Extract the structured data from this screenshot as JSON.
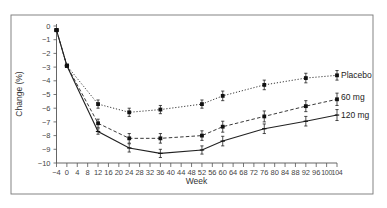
{
  "chart_data": {
    "type": "line",
    "title": "",
    "xlabel": "Week",
    "ylabel": "Change (%)",
    "xlim": [
      -4,
      104
    ],
    "ylim": [
      -10,
      0
    ],
    "x_ticks": [
      -4,
      0,
      4,
      8,
      12,
      16,
      20,
      24,
      28,
      32,
      36,
      40,
      44,
      48,
      52,
      56,
      60,
      64,
      68,
      72,
      76,
      80,
      84,
      88,
      92,
      96,
      100,
      104
    ],
    "y_ticks": [
      0,
      -1,
      -2,
      -3,
      -4,
      -5,
      -6,
      -7,
      -8,
      -9,
      -10
    ],
    "grid": false,
    "legend_position": "right, inline at line ends",
    "x": [
      -4,
      0,
      12,
      24,
      36,
      52,
      60,
      76,
      92,
      104
    ],
    "series": [
      {
        "name": "Placebo",
        "line_style": "dotted",
        "marker": "square",
        "values": [
          -0.3,
          -2.9,
          -5.7,
          -6.3,
          -6.1,
          -5.7,
          -5.1,
          -4.3,
          -3.8,
          -3.6
        ],
        "error": [
          0.3,
          0.2,
          0.3,
          0.3,
          0.3,
          0.3,
          0.35,
          0.35,
          0.35,
          0.35
        ]
      },
      {
        "name": "60 mg",
        "line_style": "dashed",
        "marker": "square",
        "values": [
          -0.3,
          -2.9,
          -7.1,
          -8.2,
          -8.2,
          -8.0,
          -7.35,
          -6.6,
          -5.85,
          -5.35
        ],
        "error": [
          0.3,
          0.2,
          0.3,
          0.35,
          0.35,
          0.35,
          0.4,
          0.4,
          0.4,
          0.45
        ]
      },
      {
        "name": "120 mg",
        "line_style": "solid",
        "marker": "tick",
        "values": [
          -0.3,
          -2.9,
          -7.7,
          -8.9,
          -9.3,
          -9.05,
          -8.4,
          -7.5,
          -6.95,
          -6.5
        ],
        "error": [
          0.3,
          0.2,
          0.2,
          0.3,
          0.3,
          0.3,
          0.35,
          0.35,
          0.35,
          0.4
        ]
      }
    ]
  },
  "labels": {
    "xlabel": "Week",
    "ylabel": "Change (%)",
    "legend": [
      "Placebo",
      "60 mg",
      "120 mg"
    ]
  }
}
